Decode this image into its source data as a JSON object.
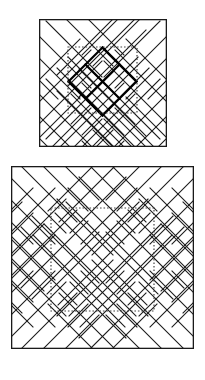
{
  "page": {
    "background": "#ffffff",
    "width": 205,
    "height": 380
  },
  "style": {
    "line_color": "#1a1a1a",
    "bold_color": "#000000",
    "dotted_color": "#444444",
    "fill_color": "#ffffff",
    "lattice_stroke_width": 1.1,
    "bold_stroke_width": 2.2,
    "frame_stroke_width": 1.3,
    "dotted_stroke_width": 1.2,
    "dotted_dasharray": "1.6 1.9"
  },
  "figures": [
    {
      "id": "figure-top",
      "label": "Top diagram",
      "frame": {
        "x": 39,
        "y": 19,
        "width": 128,
        "height": 128
      },
      "lattice": {
        "cell": 11.3,
        "angle_deg": 45,
        "description": "45-degree diamond grid clipped to the square frame"
      },
      "dotted_rect": {
        "x": 68,
        "y": 47,
        "width": 69,
        "height": 66
      },
      "bold_diamond": {
        "cx": 102.5,
        "cy": 80,
        "rx": 34,
        "ry": 33,
        "description": "emphasized diamond outline through the centre"
      },
      "bold_cross": {
        "description": "bold diagonal strokes forming an X through the centre diamond",
        "present": true
      }
    },
    {
      "id": "figure-bottom",
      "label": "Bottom diagram",
      "frame": {
        "x": 11,
        "y": 166,
        "width": 183,
        "height": 183
      },
      "lattice": {
        "cell": 11.3,
        "angle_deg": 45,
        "description": "45-degree diamond grid clipped to the square frame with large open octagon void at centre"
      },
      "dotted_rect": {
        "x": 51,
        "y": 208,
        "width": 103,
        "height": 103
      },
      "bold_diamond": null,
      "bold_cross": {
        "present": false
      }
    }
  ]
}
